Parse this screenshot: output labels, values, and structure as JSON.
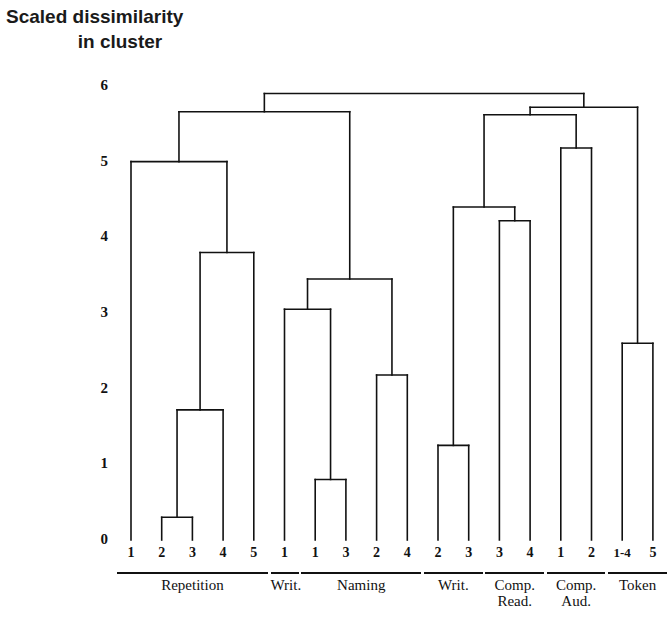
{
  "title": {
    "line1": "Scaled dissimilarity",
    "line2": "in cluster"
  },
  "axis": {
    "y_ticks": [
      "6",
      "5",
      "4",
      "3",
      "2",
      "1",
      "0"
    ]
  },
  "leaves": [
    {
      "label": "1"
    },
    {
      "label": "2"
    },
    {
      "label": "3"
    },
    {
      "label": "4"
    },
    {
      "label": "5"
    },
    {
      "label": "1"
    },
    {
      "label": "1"
    },
    {
      "label": "3"
    },
    {
      "label": "2"
    },
    {
      "label": "4"
    },
    {
      "label": "2"
    },
    {
      "label": "3"
    },
    {
      "label": "3"
    },
    {
      "label": "4"
    },
    {
      "label": "1"
    },
    {
      "label": "2"
    },
    {
      "label": "1-4"
    },
    {
      "label": "5"
    }
  ],
  "groups": [
    {
      "label": "Repetition",
      "label2": ""
    },
    {
      "label": "Writ.",
      "label2": ""
    },
    {
      "label": "Naming",
      "label2": ""
    },
    {
      "label": "Writ.",
      "label2": ""
    },
    {
      "label": "Comp.",
      "label2": "Read."
    },
    {
      "label": "Comp.",
      "label2": "Aud."
    },
    {
      "label": "Token",
      "label2": ""
    }
  ],
  "chart_data": {
    "type": "dendrogram",
    "title": "Scaled dissimilarity in cluster",
    "xlabel": "",
    "ylabel": "Scaled dissimilarity in cluster",
    "ylim": [
      0,
      6
    ],
    "grid": false,
    "legend": "none",
    "line_color": "#111111",
    "leaf_labels": [
      "1",
      "2",
      "3",
      "4",
      "5",
      "1",
      "1",
      "3",
      "2",
      "4",
      "2",
      "3",
      "3",
      "4",
      "1",
      "2",
      "1-4",
      "5"
    ],
    "group_labels": [
      "Repetition",
      "Writ.",
      "Naming",
      "Writ.",
      "Comp. Read.",
      "Comp. Aud.",
      "Token"
    ],
    "group_spans": [
      [
        0,
        4
      ],
      [
        5,
        5
      ],
      [
        6,
        9
      ],
      [
        10,
        11
      ],
      [
        12,
        13
      ],
      [
        14,
        15
      ],
      [
        16,
        17
      ]
    ],
    "merges": [
      {
        "id": "m1",
        "children": [
          "leaf1",
          "leaf2"
        ],
        "height": 0.3,
        "note": "Repetition 2+3"
      },
      {
        "id": "m2",
        "children": [
          "m1",
          "leaf3"
        ],
        "height": 1.72,
        "note": "+ Repetition 4"
      },
      {
        "id": "m3",
        "children": [
          "m2",
          "leaf4"
        ],
        "height": 3.8,
        "note": "+ Repetition 5"
      },
      {
        "id": "m4",
        "children": [
          "leaf0",
          "m3"
        ],
        "height": 5.0,
        "note": "+ Repetition 1"
      },
      {
        "id": "m5",
        "children": [
          "leaf6",
          "leaf7"
        ],
        "height": 0.8,
        "note": "Naming 1+3"
      },
      {
        "id": "m6",
        "children": [
          "leaf5",
          "m5"
        ],
        "height": 3.05,
        "note": "Writ.1 + Naming(1,3)"
      },
      {
        "id": "m7",
        "children": [
          "leaf8",
          "leaf9"
        ],
        "height": 2.18,
        "note": "Naming 2+4"
      },
      {
        "id": "m8",
        "children": [
          "m6",
          "m7"
        ],
        "height": 3.45,
        "note": "Naming block"
      },
      {
        "id": "m9",
        "children": [
          "m4",
          "m8"
        ],
        "height": 5.66,
        "note": "left super-cluster"
      },
      {
        "id": "m10",
        "children": [
          "leaf10",
          "leaf11"
        ],
        "height": 1.25,
        "note": "Writ. 2+3"
      },
      {
        "id": "m11",
        "children": [
          "leaf12",
          "leaf13"
        ],
        "height": 4.22,
        "note": "Comp. Read. 3+4"
      },
      {
        "id": "m12",
        "children": [
          "m10",
          "m11"
        ],
        "height": 4.4,
        "note": "Writ.+Comp.Read."
      },
      {
        "id": "m13",
        "children": [
          "leaf14",
          "leaf15"
        ],
        "height": 5.18,
        "note": "Comp. Aud. 1+2"
      },
      {
        "id": "m14",
        "children": [
          "m12",
          "m13"
        ],
        "height": 5.62,
        "note": "right inner"
      },
      {
        "id": "m15",
        "children": [
          "leaf16",
          "leaf17"
        ],
        "height": 2.6,
        "note": "Token 1-4 + 5"
      },
      {
        "id": "m16",
        "children": [
          "m14",
          "m15"
        ],
        "height": 5.72,
        "note": "right super-cluster"
      },
      {
        "id": "m17",
        "children": [
          "m9",
          "m16"
        ],
        "height": 5.9,
        "note": "root"
      }
    ]
  }
}
